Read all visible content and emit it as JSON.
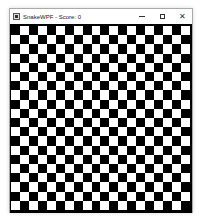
{
  "window": {
    "title": "SnakeWPF - Score: 0",
    "icon": "app-icon",
    "controls": {
      "minimize": "minimize-icon",
      "maximize": "maximize-icon",
      "close": "close-icon",
      "close_glyph": "✕"
    }
  },
  "game": {
    "score": 0,
    "board": {
      "columns": 20,
      "rows": 20,
      "dark_color": "#000000",
      "light_color": "#ffffff",
      "first_cell": "dark"
    }
  }
}
